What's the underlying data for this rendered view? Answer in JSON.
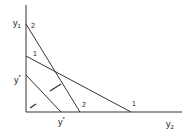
{
  "diagram": {
    "axes": {
      "y_axis_label_main": "y",
      "y_axis_label_sub": "1",
      "x_axis_label_main": "y",
      "x_axis_label_sub": "2",
      "stroke": "#333333"
    },
    "lines": [
      {
        "id": "2",
        "label_top": "2",
        "label_bottom": "2"
      },
      {
        "id": "1",
        "label_top": "1",
        "label_bottom": "1"
      },
      {
        "id": "y-star",
        "y_label_main": "y",
        "y_label_sup": "*",
        "x_label_main": "y",
        "x_label_sup": "*"
      }
    ],
    "arrows": [
      {
        "id": "arrow-between-lines"
      },
      {
        "id": "arrow-near-origin"
      }
    ]
  }
}
